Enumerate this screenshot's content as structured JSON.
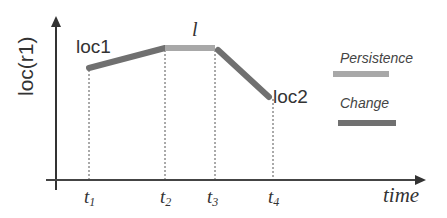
{
  "diagram": {
    "y_axis_label": "loc(r1)",
    "x_axis_label": "time",
    "points": {
      "start": "loc1",
      "end": "loc2",
      "plateau": "l"
    },
    "ticks": [
      {
        "base": "t",
        "sub": "1"
      },
      {
        "base": "t",
        "sub": "2"
      },
      {
        "base": "t",
        "sub": "3"
      },
      {
        "base": "t",
        "sub": "4"
      }
    ],
    "legend": [
      {
        "label": "Persistence",
        "color": "#a8a8a8"
      },
      {
        "label": "Change",
        "color": "#707070"
      }
    ],
    "colors": {
      "persistence": "#a8a8a8",
      "change": "#707070",
      "axis": "#333333"
    }
  }
}
